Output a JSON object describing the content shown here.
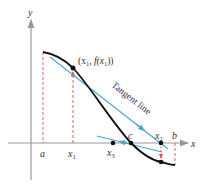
{
  "figure": {
    "axes": {
      "x_label": "x",
      "y_label": "y"
    },
    "x_ticks": {
      "a": "a",
      "x1": "x",
      "x1_sub": "1",
      "x3": "x",
      "x3_sub": "3",
      "c": "c",
      "x2": "x",
      "x2_sub": "2",
      "b": "b"
    },
    "point_label": {
      "open": "(x",
      "sub1": "1",
      "mid": ", f(x",
      "sub2": "1",
      "close": "))"
    },
    "tangent_label": "Tangent line",
    "colors": {
      "curve": "#111111",
      "tangent": "#4fa3d1",
      "dashed": "#e0504a",
      "axis": "#999999"
    }
  }
}
